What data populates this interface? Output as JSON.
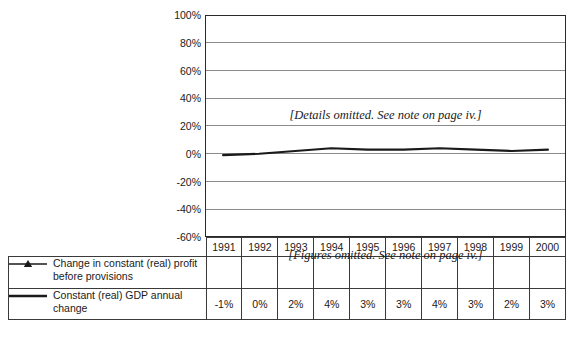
{
  "chart_data": {
    "type": "line",
    "title": "",
    "xlabel": "",
    "ylabel": "",
    "categories": [
      "1991",
      "1992",
      "1993",
      "1994",
      "1995",
      "1996",
      "1997",
      "1998",
      "1999",
      "2000"
    ],
    "ylim": [
      -60,
      100
    ],
    "ytick_labels": [
      "100%",
      "80%",
      "60%",
      "40%",
      "20%",
      "0%",
      "-20%",
      "-40%",
      "-60%"
    ],
    "ytick_values": [
      100,
      80,
      60,
      40,
      20,
      0,
      -20,
      -40,
      -60
    ],
    "grid": true,
    "legend_position": "bottom-table",
    "series": [
      {
        "name": "Change in constant (real) profit before provisions",
        "marker": "triangle",
        "values": [
          null,
          null,
          null,
          null,
          null,
          null,
          null,
          null,
          null,
          null
        ],
        "value_labels": [
          "",
          "",
          "",
          "",
          "",
          "",
          "",
          "",
          "",
          ""
        ],
        "omitted": true,
        "color": "#1a1a1a"
      },
      {
        "name": "Constant (real) GDP annual change",
        "marker": "none",
        "values": [
          -1,
          0,
          2,
          4,
          3,
          3,
          4,
          3,
          2,
          3
        ],
        "value_labels": [
          "-1%",
          "0%",
          "2%",
          "4%",
          "3%",
          "3%",
          "4%",
          "3%",
          "2%",
          "3%"
        ],
        "omitted": false,
        "color": "#1a1a1a"
      }
    ],
    "annotations": [
      {
        "id": "plot-note",
        "text": "[Details omitted.  See note on page iv.]",
        "location": "plot-center"
      },
      {
        "id": "table-note",
        "text": "[Figures omitted.  See note on page iv.]",
        "location": "table-row-1"
      }
    ]
  },
  "axis": {
    "yticks": [
      {
        "label": "100%"
      },
      {
        "label": "80%"
      },
      {
        "label": "60%"
      },
      {
        "label": "40%"
      },
      {
        "label": "20%"
      },
      {
        "label": "0%"
      },
      {
        "label": "-20%"
      },
      {
        "label": "-40%"
      },
      {
        "label": "-60%"
      }
    ]
  },
  "table": {
    "years": [
      "1991",
      "1992",
      "1993",
      "1994",
      "1995",
      "1996",
      "1997",
      "1998",
      "1999",
      "2000"
    ],
    "rows": [
      {
        "legend_label": "Change in constant (real) profit before provisions",
        "marker": "line-with-triangle",
        "values": [
          "",
          "",
          "",
          "",
          "",
          "",
          "",
          "",
          "",
          ""
        ]
      },
      {
        "legend_label": "Constant (real) GDP annual change",
        "marker": "plain-line",
        "values": [
          "-1%",
          "0%",
          "2%",
          "4%",
          "3%",
          "3%",
          "4%",
          "3%",
          "2%",
          "3%"
        ]
      }
    ]
  },
  "notes": {
    "plot": "[Details omitted.  See note on page iv.]",
    "table": "[Figures omitted.  See note on page iv.]"
  },
  "colors": {
    "line": "#1a1a1a",
    "grid": "#8b8b8b",
    "frame": "#2a2a2a",
    "background": "#ffffff"
  }
}
